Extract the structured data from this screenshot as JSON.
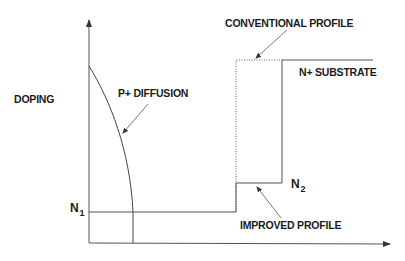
{
  "diagram": {
    "labels": {
      "y_axis": "DOPING",
      "p_diffusion": "P+ DIFFUSION",
      "conventional_profile": "CONVENTIONAL PROFILE",
      "n_substrate": "N+ SUBSTRATE",
      "improved_profile": "IMPROVED PROFILE",
      "n1_base": "N",
      "n1_sub": "1",
      "n2_base": "N",
      "n2_sub": "2"
    },
    "colors": {
      "line": "#555555",
      "text": "#1a1a1a",
      "background": "#ffffff"
    }
  }
}
